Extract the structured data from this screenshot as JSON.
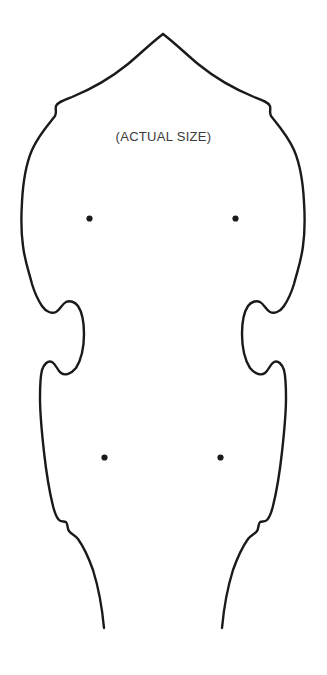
{
  "document": {
    "kind": "sewing-pattern-template",
    "background_color": "#ffffff",
    "width": 327,
    "height": 675
  },
  "annotations": {
    "size_note": "(ACTUAL SIZE)"
  },
  "pattern": {
    "outline": {
      "stroke_color": "#1a1a1a",
      "stroke_width": 2.4,
      "fill": "none",
      "closed": false,
      "description": "symmetric cut-out body outline, open at bottom hem"
    },
    "marking_dots": {
      "color": "#1a1a1a",
      "radius": 3.1,
      "points": [
        {
          "label": "upper-left-dot",
          "x": 89.5,
          "y": 218.5
        },
        {
          "label": "upper-right-dot",
          "x": 235.5,
          "y": 218.5
        },
        {
          "label": "lower-left-dot",
          "x": 104.5,
          "y": 457.5
        },
        {
          "label": "lower-right-dot",
          "x": 220.5,
          "y": 457.5
        }
      ]
    },
    "left_edge_path": "M 163 34 C 150 44 140 54 128 64 C 112 77 94 88 72 97 C 64 100 58 102 56 106 C 55 110 57 112 55 116 C 47 126 38 136 32 150 C 26 164 23 182 22 202 C 21 218 21 232 23 246 C 25 262 29 272 32 284 C 35 294 38 300 42 306 C 46 312 52 314 56 312 C 60 310 62 304 66 302 C 70 300 75 302 78 306 C 82 312 84 322 84 334 C 84 348 81 360 76 368 C 71 374 65 376 61 373 C 57 370 56 364 52 362 C 48 360 44 364 42 370 C 40 378 40 388 40 398 C 40 414 42 434 44 452 C 46 470 49 490 53 506 C 55 514 57 518 59 520 C 61 522 64 521 66 522 C 68 524 67 528 69 531 C 71 534 75 535 78 539 C 83 546 88 556 93 570 C 98 586 102 606 104 628",
    "right_edge_path": "M 163 34 C 176 44 186 54 198 64 C 214 77 232 88 254 97 C 262 100 268 102 270 106 C 271 110 269 112 271 116 C 279 126 288 136 294 150 C 300 164 303 182 304 202 C 305 218 305 232 303 246 C 301 262 297 272 294 284 C 291 294 288 300 284 306 C 280 312 274 314 270 312 C 266 310 264 304 260 302 C 256 300 251 302 248 306 C 244 312 242 322 242 334 C 242 348 245 360 250 368 C 255 374 261 376 265 373 C 269 370 270 364 274 362 C 278 360 282 364 284 370 C 286 378 286 388 286 398 C 286 414 284 434 282 452 C 280 470 277 490 273 506 C 271 514 269 518 267 520 C 265 522 262 521 260 522 C 258 524 259 528 257 531 C 255 534 251 535 248 539 C 243 546 238 556 233 570 C 228 586 224 606 222 628"
  }
}
